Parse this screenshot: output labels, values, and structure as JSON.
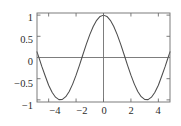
{
  "chart_data": {
    "type": "line",
    "title": "",
    "subtitle": "",
    "xlabel": "",
    "ylabel": "",
    "function": "cos(x)",
    "xlim": [
      -4.85,
      4.85
    ],
    "ylim": [
      -1.05,
      1.05
    ],
    "grid": false,
    "legend": null,
    "legend_position": "none",
    "frame": "box",
    "tick_direction": "in",
    "zero_lines": {
      "horizontal_at_y": 0,
      "vertical_at_x": 0
    },
    "xticks": [
      -4,
      -2,
      0,
      2,
      4
    ],
    "xtick_labels": [
      "−4",
      "−2",
      "0",
      "2",
      "4"
    ],
    "yticks": [
      -1,
      -0.5,
      0,
      0.5,
      1
    ],
    "ytick_labels": [
      "−1",
      "−0.5",
      "0",
      "0.5",
      "1"
    ],
    "series": [
      {
        "name": "cos(x)",
        "color": "#4d4d4d",
        "line_width": 1,
        "x": [
          -4.85,
          -4.7,
          -4.5,
          -4.25,
          -4.0,
          -3.75,
          -3.5,
          -3.25,
          -3.0,
          -2.75,
          -2.5,
          -2.25,
          -2.0,
          -1.75,
          -1.5708,
          -1.5,
          -1.25,
          -1.0,
          -0.75,
          -0.5,
          -0.25,
          0.0,
          0.25,
          0.5,
          0.75,
          1.0,
          1.25,
          1.5,
          1.5708,
          1.75,
          2.0,
          2.25,
          2.5,
          2.75,
          3.0,
          3.25,
          3.5,
          3.75,
          4.0,
          4.25,
          4.5,
          4.7,
          4.85
        ],
        "y": [
          0.1334,
          -0.0124,
          -0.2108,
          -0.4357,
          -0.6536,
          -0.8206,
          -0.9365,
          -0.994,
          -0.99,
          -0.9243,
          -0.8011,
          -0.6282,
          -0.4161,
          -0.1782,
          0.0,
          0.0707,
          0.3153,
          0.5403,
          0.7317,
          0.8776,
          0.9689,
          1.0,
          0.9689,
          0.8776,
          0.7317,
          0.5403,
          0.3153,
          0.0707,
          0.0,
          -0.1782,
          -0.4161,
          -0.6282,
          -0.8011,
          -0.9243,
          -0.99,
          -0.994,
          -0.9365,
          -0.8206,
          -0.6536,
          -0.4357,
          -0.2108,
          -0.0124,
          0.1334
        ]
      }
    ],
    "annotations": [],
    "colors": {
      "curve": "#4d4d4d",
      "frame": "#6e6e6e",
      "zero_line": "#6e6e6e",
      "tick": "#6e6e6e",
      "tick_label": "#2b2b2b",
      "background": "#ffffff"
    }
  }
}
